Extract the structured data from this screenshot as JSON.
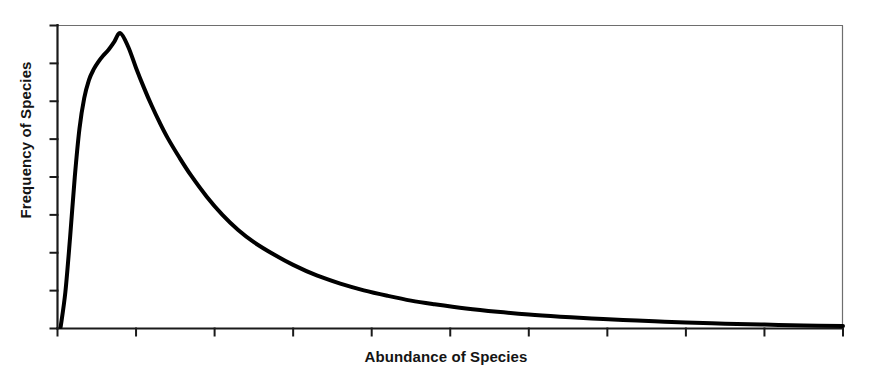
{
  "chart_data": {
    "type": "line",
    "title": "",
    "subtitle": "",
    "xlabel": "Abundance of Species",
    "ylabel": "Frequency of Species",
    "grid": false,
    "legend": false,
    "legend_position": "none",
    "annotations": [],
    "xlim": [
      0,
      100
    ],
    "ylim": [
      0,
      100
    ],
    "xticks": [
      0,
      10,
      20,
      30,
      40,
      50,
      60,
      70,
      80,
      90,
      100
    ],
    "xtick_labels": [
      "",
      "",
      "",
      "",
      "",
      "",
      "",
      "",
      "",
      "",
      ""
    ],
    "yticks": [
      0,
      12.5,
      25,
      37.5,
      50,
      62.5,
      75,
      87.5,
      100
    ],
    "ytick_labels": [
      "",
      "",
      "",
      "",
      "",
      "",
      "",
      "",
      ""
    ],
    "series": [
      {
        "name": "Species abundance distribution",
        "color": "#000000",
        "line_width": 4,
        "x": [
          0.4,
          1.0,
          1.6,
          2.2,
          2.8,
          3.4,
          4.0,
          4.6,
          5.2,
          5.8,
          6.5,
          7.2,
          8.0,
          9.0,
          10.0,
          11.0,
          12.0,
          13.0,
          14.0,
          15.5,
          17.0,
          19.0,
          21.0,
          23.0,
          25.0,
          27.5,
          30.0,
          33.0,
          36.0,
          39.0,
          42.0,
          45.0,
          48.0,
          52.0,
          56.0,
          60.0,
          64.0,
          68.0,
          72.0,
          76.0,
          80.0,
          85.0,
          90.0,
          95.0,
          100.0
        ],
        "y": [
          0.5,
          12.0,
          30.0,
          50.0,
          66.0,
          76.0,
          82.0,
          85.5,
          88.0,
          90.0,
          92.0,
          94.5,
          97.5,
          93.0,
          86.0,
          79.5,
          73.5,
          68.0,
          63.0,
          56.5,
          50.5,
          43.5,
          37.5,
          32.5,
          28.5,
          24.5,
          21.0,
          17.5,
          14.8,
          12.6,
          10.8,
          9.2,
          8.0,
          6.6,
          5.5,
          4.6,
          3.9,
          3.3,
          2.8,
          2.4,
          2.0,
          1.6,
          1.3,
          1.0,
          0.8
        ]
      }
    ]
  },
  "axes": {
    "ylabel_text": "Frequency of Species",
    "xlabel_text": "Abundance of Species"
  },
  "style": {
    "line_color": "#000000",
    "axis_color": "#1a1a1a",
    "frame_color": "#6e6e6e",
    "background": "#ffffff"
  }
}
